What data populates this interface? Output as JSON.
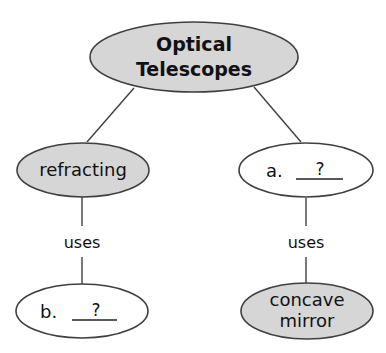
{
  "diagram": {
    "type": "concept-map",
    "root": {
      "label_line1": "Optical",
      "label_line2": "Telescopes"
    },
    "branches": [
      {
        "node": {
          "label": "refracting",
          "filled": true
        },
        "link_label": "uses",
        "child": {
          "prefix": "b.",
          "blank": "?",
          "filled": false
        }
      },
      {
        "node": {
          "prefix": "a.",
          "blank": "?",
          "filled": false
        },
        "link_label": "uses",
        "child": {
          "label_line1": "concave",
          "label_line2": "mirror",
          "filled": true
        }
      }
    ],
    "colors": {
      "filled_node": "#d6d6d6",
      "blank_node": "#ffffff",
      "stroke": "#3f3f3f",
      "text": "#111111"
    }
  }
}
